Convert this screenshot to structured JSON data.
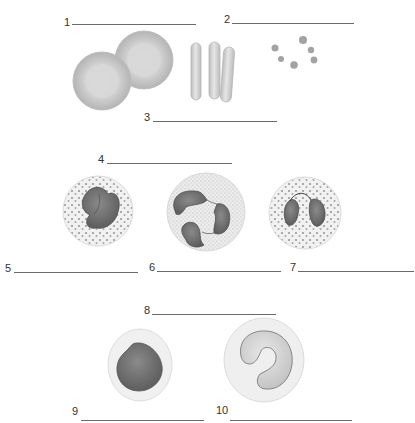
{
  "labels": [
    {
      "id": "1",
      "number": "1",
      "answer": ""
    },
    {
      "id": "2",
      "number": "2",
      "answer": ""
    },
    {
      "id": "3",
      "number": "3",
      "answer": ""
    },
    {
      "id": "4",
      "number": "4",
      "answer": ""
    },
    {
      "id": "5",
      "number": "5",
      "answer": ""
    },
    {
      "id": "6",
      "number": "6",
      "answer": ""
    },
    {
      "id": "7",
      "number": "7",
      "answer": ""
    },
    {
      "id": "8",
      "number": "8",
      "answer": ""
    },
    {
      "id": "9",
      "number": "9",
      "answer": ""
    },
    {
      "id": "10",
      "number": "10",
      "answer": ""
    }
  ],
  "figures": [
    {
      "name": "red-blood-cells-face",
      "depicts": "two biconcave discs"
    },
    {
      "name": "red-blood-cells-side",
      "depicts": "three rod-shaped side views"
    },
    {
      "name": "platelets",
      "depicts": "small cell fragments"
    },
    {
      "name": "granulocyte-bilobed-granular",
      "depicts": "cell with dense granules, bilobed nucleus"
    },
    {
      "name": "granulocyte-multilobed",
      "depicts": "cell with fine granules, multilobed nucleus"
    },
    {
      "name": "granulocyte-bilobed-coarse",
      "depicts": "cell with coarse granules, bilobed connected nucleus"
    },
    {
      "name": "agranulocyte-round-nucleus",
      "depicts": "cell with large round nucleus"
    },
    {
      "name": "agranulocyte-kidney-nucleus",
      "depicts": "cell with horseshoe-shaped nucleus"
    }
  ],
  "colors": {
    "line": "#6a6a6a",
    "rbc": "#c9c9c9",
    "nucleus": "#6f6f6f",
    "cytoplasm": "#ececec"
  }
}
